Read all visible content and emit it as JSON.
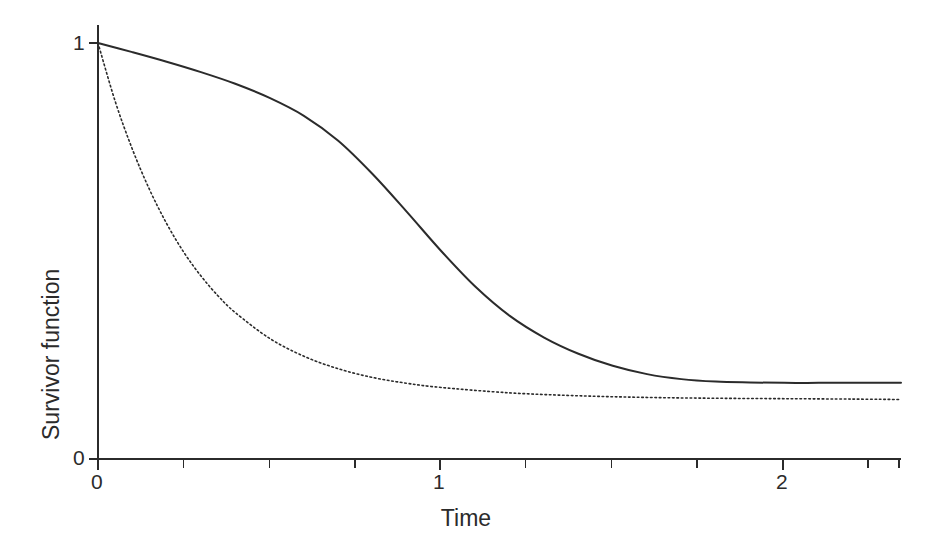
{
  "chart_data": {
    "type": "line",
    "title": "",
    "subtitle": "",
    "xlabel": "Time",
    "ylabel": "Survivor function",
    "xlim": [
      0,
      2.34
    ],
    "ylim": [
      0,
      1.05
    ],
    "xticks": [
      0,
      1,
      2
    ],
    "xtick_labels": [
      "0",
      "1",
      "2"
    ],
    "xminor_ticks": [
      0.25,
      0.5,
      0.75,
      1.25,
      1.5,
      1.75,
      2.25
    ],
    "yticks": [
      0,
      1
    ],
    "ytick_labels": [
      "0",
      "1"
    ],
    "grid": false,
    "legend": "none",
    "axis_color": "#2b2b2b",
    "background_color": "#ffffff",
    "series": [
      {
        "name": "solid-curve",
        "style": "solid",
        "color": "#2b2b2b",
        "linewidth": 2.0,
        "description": "Sigmoid survivor curve with a heavy plateau near 0.18",
        "x": [
          0,
          0.1,
          0.2,
          0.3,
          0.4,
          0.5,
          0.6,
          0.7,
          0.8,
          0.9,
          1.0,
          1.1,
          1.2,
          1.3,
          1.4,
          1.5,
          1.6,
          1.7,
          1.8,
          1.9,
          2.0,
          2.1,
          2.2,
          2.34
        ],
        "y": [
          1.0,
          0.978,
          0.955,
          0.93,
          0.902,
          0.868,
          0.825,
          0.765,
          0.685,
          0.594,
          0.5,
          0.414,
          0.344,
          0.292,
          0.253,
          0.224,
          0.204,
          0.192,
          0.186,
          0.184,
          0.183,
          0.183,
          0.183,
          0.183
        ]
      },
      {
        "name": "dotted-curve",
        "style": "dotted",
        "color": "#2b2b2b",
        "linewidth": 1.6,
        "description": "Exponential-decay survivor curve flattening near 0.145",
        "x": [
          0,
          0.05,
          0.1,
          0.15,
          0.2,
          0.25,
          0.3,
          0.35,
          0.4,
          0.5,
          0.6,
          0.7,
          0.8,
          0.9,
          1.0,
          1.2,
          1.4,
          1.6,
          1.8,
          2.0,
          2.2,
          2.34
        ],
        "y": [
          1.0,
          0.86,
          0.745,
          0.648,
          0.566,
          0.497,
          0.44,
          0.392,
          0.352,
          0.29,
          0.247,
          0.217,
          0.196,
          0.182,
          0.172,
          0.159,
          0.152,
          0.148,
          0.146,
          0.145,
          0.144,
          0.143
        ]
      }
    ]
  },
  "axes": {
    "x_title": "Time",
    "y_title": "Survivor function",
    "x_tick_0": "0",
    "x_tick_1": "1",
    "x_tick_2": "2",
    "y_tick_0": "0",
    "y_tick_1": "1"
  }
}
